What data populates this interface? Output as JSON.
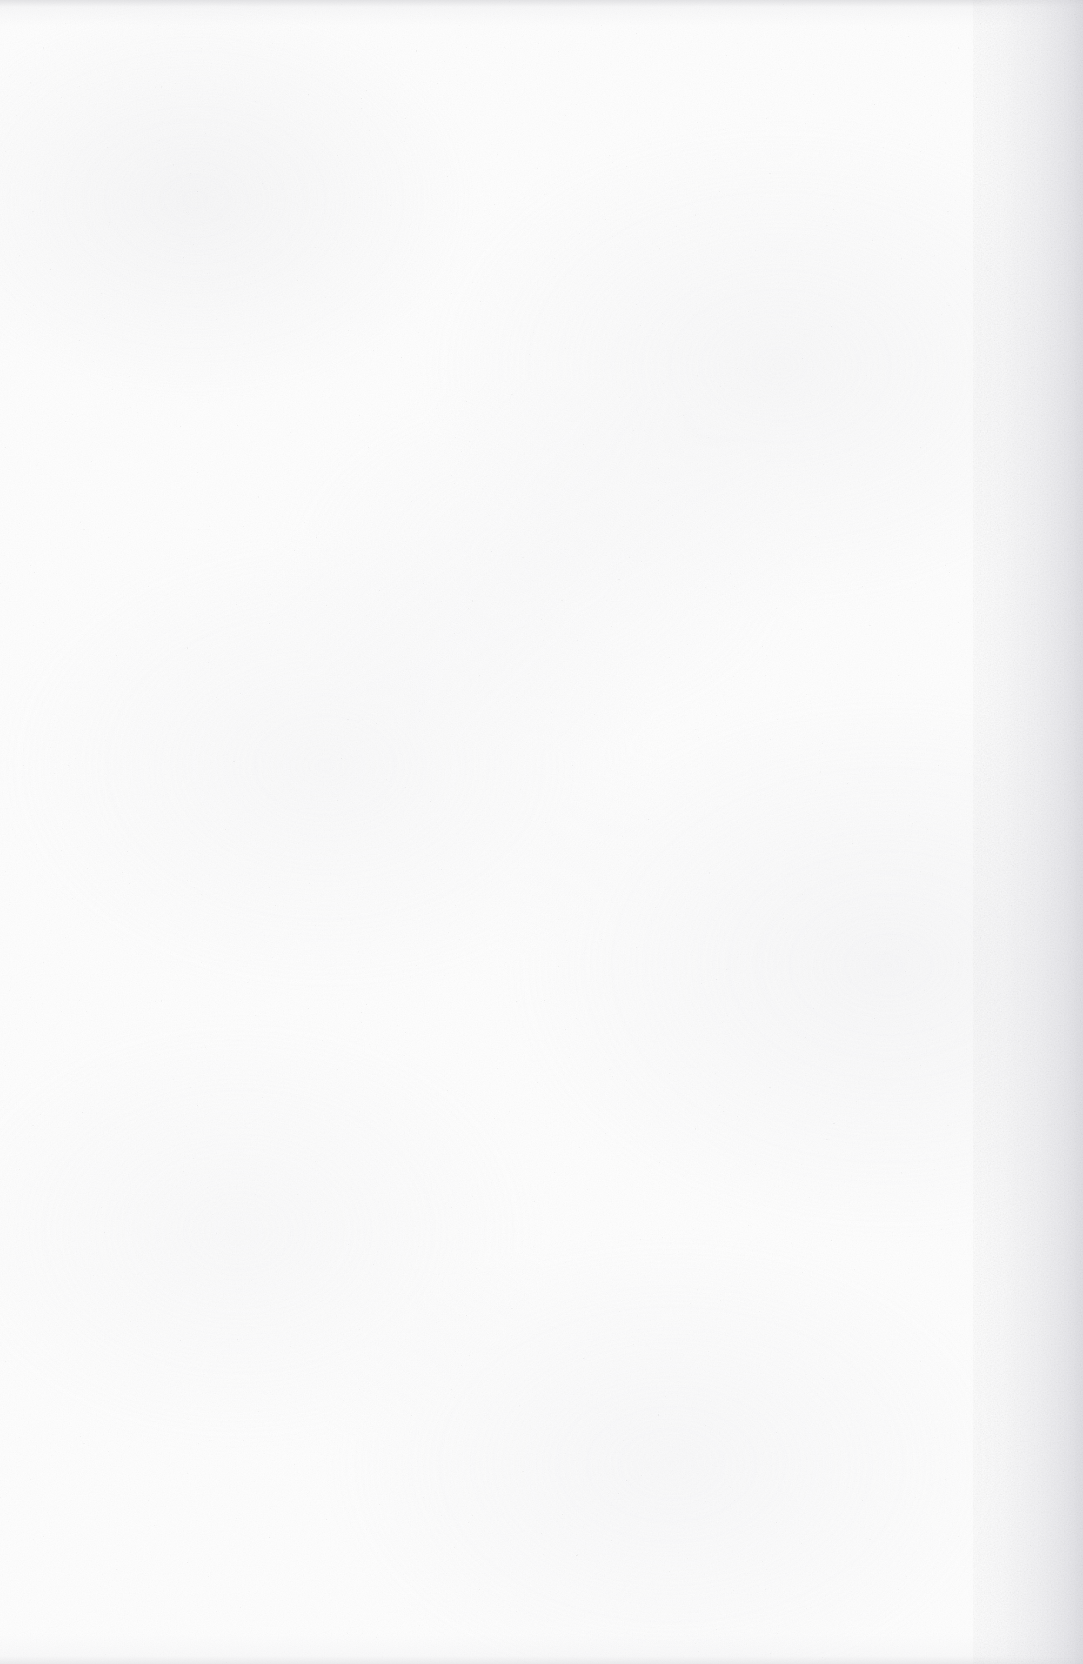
{
  "document": {
    "page_kind": "scanned-blank-page",
    "orientation": "portrait",
    "width_px": 1083,
    "height_px": 1664,
    "visible_text": "",
    "page_number_text": "",
    "header_text": "",
    "footer_text": "",
    "marginalia_text": ""
  },
  "content": {
    "blocks": [],
    "text_lines": [],
    "figures": [],
    "tables": [],
    "note": ""
  },
  "appearance": {
    "paper_color": "#fdfdfd",
    "paper_base_color": "#fefefe",
    "grain_color": "#e6e6ea",
    "mottle_color": "#eaeaed",
    "edge_shadow_color": "#cdcdd1",
    "right_band_color": "#d6d6dc",
    "top_edge_line_color": "#cdcdd1",
    "bottom_edge_line_color": "#d2d2d6"
  }
}
